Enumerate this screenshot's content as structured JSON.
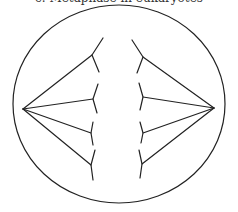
{
  "caption": "c. Metaphase in eukaryotes",
  "diagram": {
    "type": "cell-division-spindle",
    "cell": {
      "cx": 119,
      "cy": 104,
      "rx": 106,
      "ry": 99
    },
    "poles": {
      "left": {
        "x": 23,
        "y": 109
      },
      "right": {
        "x": 214,
        "y": 108
      }
    },
    "chromosomes_left": [
      {
        "top": [
          103,
          38
        ],
        "junction": [
          92,
          55
        ],
        "bottom": [
          99,
          72
        ]
      },
      {
        "top": [
          98,
          84
        ],
        "junction": [
          93,
          99
        ],
        "bottom": [
          97,
          113
        ]
      },
      {
        "top": [
          93,
          122
        ],
        "junction": [
          91,
          133
        ],
        "bottom": [
          93,
          145
        ]
      },
      {
        "top": [
          95,
          150
        ],
        "junction": [
          91,
          165
        ],
        "bottom": [
          93,
          180
        ]
      }
    ],
    "chromosomes_right": [
      {
        "top": [
          132,
          40
        ],
        "junction": [
          143,
          57
        ],
        "bottom": [
          137,
          73
        ]
      },
      {
        "top": [
          139,
          83
        ],
        "junction": [
          143,
          97
        ],
        "bottom": [
          140,
          110
        ]
      },
      {
        "top": [
          140,
          122
        ],
        "junction": [
          143,
          133
        ],
        "bottom": [
          141,
          143
        ]
      },
      {
        "top": [
          139,
          150
        ],
        "junction": [
          142,
          164
        ],
        "bottom": [
          140,
          178
        ]
      }
    ]
  }
}
